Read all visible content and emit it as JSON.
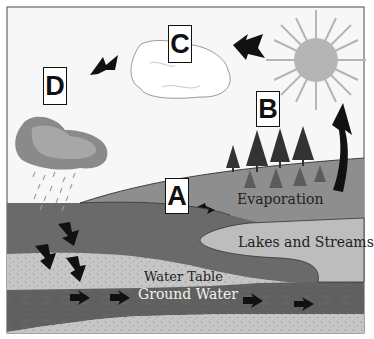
{
  "labels": {
    "A": "A",
    "B": "B",
    "C": "C",
    "D": "D"
  },
  "regions": {
    "evaporation": "Evaporation",
    "lakes": "Lakes and Streams",
    "water_table": "Water Table",
    "ground_water": "Ground Water"
  },
  "elements": {
    "sun": "sun-icon",
    "cloud_white": "cloud-icon",
    "cloud_rain": "rain-cloud-icon",
    "trees": "tree-icon",
    "arrows": "arrow-icon"
  },
  "colors": {
    "sky": "#f7f7f7",
    "hill": "#8e8e8e",
    "soil_dark": "#6a6a6a",
    "lake": "#bdbdbd",
    "sand": "#c6c6c6",
    "ground_water": "#606060",
    "sun": "#b5b5b5",
    "rain_cloud_outer": "#8a8a8a",
    "rain_cloud_inner": "#a7a7a7",
    "arrow": "#111111"
  }
}
